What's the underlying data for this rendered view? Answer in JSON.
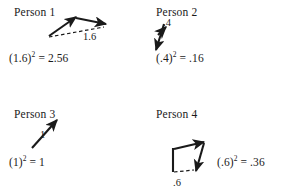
{
  "figure": {
    "background_color": "#ffffff",
    "ink_color": "#1a1a1a",
    "caption_font_style": "serif"
  },
  "panels": [
    {
      "id": "person1",
      "title": "Person 1",
      "magnitude_label": "1.6",
      "equation_base": "(1.6)",
      "equation_exponent": "2",
      "equation_rest": " = 2.56",
      "equation_full": "(1.6)2 = 2.56",
      "resultant_value": "1.6",
      "squared_value": "2.56",
      "vector_style": "two-vectors-head-to-tail-with-dashed-resultant",
      "resultant_line_style": "dashed"
    },
    {
      "id": "person2",
      "title": "Person 2",
      "magnitude_label": ".4",
      "equation_base": "(.4)",
      "equation_exponent": "2",
      "equation_rest": " = .16",
      "equation_full": "(.4)2 = .16",
      "resultant_value": ".4",
      "squared_value": ".16",
      "vector_style": "opposing-vectors-short-upward-resultant",
      "resultant_line_style": "solid"
    },
    {
      "id": "person3",
      "title": "Person 3",
      "magnitude_label": "1",
      "equation_base": "(1)",
      "equation_exponent": "2",
      "equation_rest": " = 1",
      "equation_full": "(1)2 = 1",
      "resultant_value": "1",
      "squared_value": "1",
      "vector_style": "single-diagonal-vector",
      "resultant_line_style": "solid"
    },
    {
      "id": "person4",
      "title": "Person 4",
      "magnitude_label": ".6",
      "equation_base": "(.6)",
      "equation_exponent": "2",
      "equation_rest": " = .36",
      "equation_full": "(.6)2 = .36",
      "resultant_value": ".6",
      "squared_value": ".36",
      "vector_style": "two-vectors-head-to-tail-with-dashed-resultant",
      "resultant_line_style": "dashed"
    }
  ]
}
